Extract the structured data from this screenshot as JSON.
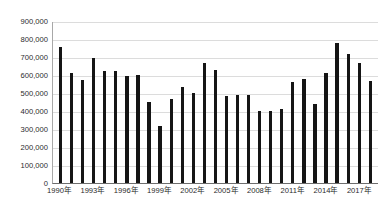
{
  "chart_data": {
    "type": "bar",
    "title": "",
    "subtitle": "",
    "xlabel": "",
    "ylabel": "",
    "ylim": [
      0,
      900000
    ],
    "ytick_step": 100000,
    "grid": true,
    "legend": null,
    "bar_color": "#151515",
    "gridline_color": "#dcdcdc",
    "axis_color": "#6e6e6e",
    "background": "#ffffff",
    "ytick_labels": [
      "900,000",
      "800,000",
      "700,000",
      "600,000",
      "500,000",
      "400,000",
      "300,000",
      "200,000",
      "100,000",
      "0"
    ],
    "ytick_values": [
      900000,
      800000,
      700000,
      600000,
      500000,
      400000,
      300000,
      200000,
      100000,
      0
    ],
    "xtick_labels": [
      "1990年",
      "1993年",
      "1996年",
      "1999年",
      "2002年",
      "2005年",
      "2008年",
      "2011年",
      "2014年",
      "2017年"
    ],
    "xtick_indices": [
      0,
      3,
      6,
      9,
      12,
      15,
      18,
      21,
      24,
      27
    ],
    "categories": [
      "1990年",
      "1991年",
      "1992年",
      "1993年",
      "1994年",
      "1995年",
      "1996年",
      "1997年",
      "1998年",
      "1999年",
      "2000年",
      "2001年",
      "2002年",
      "2003年",
      "2004年",
      "2005年",
      "2006年",
      "2007年",
      "2008年",
      "2009年",
      "2010年",
      "2011年",
      "2012年",
      "2013年",
      "2014年",
      "2015年",
      "2016年",
      "2017年",
      "2018年"
    ],
    "values": [
      755000,
      612000,
      573000,
      697000,
      620000,
      622000,
      596000,
      600000,
      448000,
      317000,
      469000,
      532000,
      500000,
      665000,
      630000,
      483000,
      488000,
      487000,
      400000,
      398000,
      413000,
      561000,
      580000,
      440000,
      613000,
      778000,
      714000,
      666000,
      567000
    ]
  }
}
